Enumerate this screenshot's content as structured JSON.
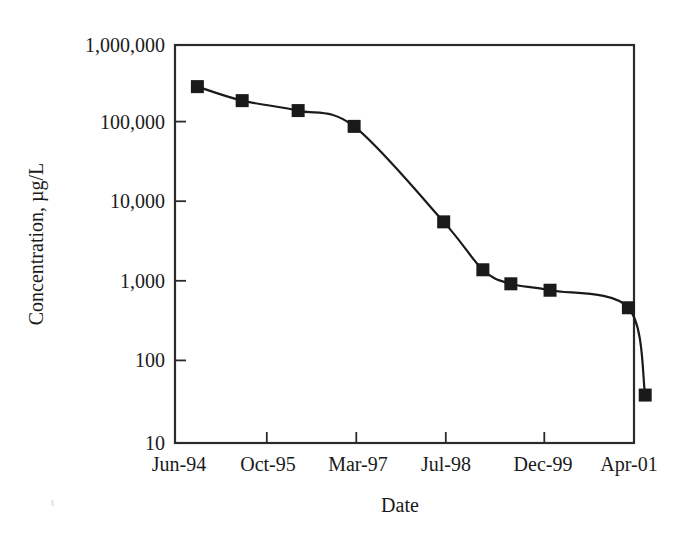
{
  "chart_data": {
    "type": "line",
    "title": "",
    "xlabel": "Date",
    "ylabel": "Concentration, µg/L",
    "yscale": "log",
    "ylim": [
      10,
      1000000
    ],
    "ytick_labels": [
      "1,000,000",
      "100,000",
      "10,000",
      "1,000",
      "100",
      "10"
    ],
    "ytick_values": [
      1000000,
      100000,
      10000,
      1000,
      100,
      10
    ],
    "xtick_labels": [
      "Jun-94",
      "Oct-95",
      "Mar-97",
      "Jul-98",
      "Dec-99",
      "Apr-01"
    ],
    "xtick_months": [
      0,
      16,
      33,
      49,
      66,
      82
    ],
    "xlim_months": [
      0,
      82
    ],
    "grid": false,
    "legend": false,
    "marker": "filled-square",
    "marker_color": "#1a1a1a",
    "line_color": "#1a1a1a",
    "series": [
      {
        "name": "Concentration",
        "points": [
          {
            "x_label": "Oct-94",
            "x_months": 4,
            "y": 300000
          },
          {
            "x_label": "Jun-95",
            "x_months": 12,
            "y": 200000
          },
          {
            "x_label": "Apr-96",
            "x_months": 22,
            "y": 150000
          },
          {
            "x_label": "Feb-97",
            "x_months": 32,
            "y": 95000
          },
          {
            "x_label": "Jun-98",
            "x_months": 48,
            "y": 6000
          },
          {
            "x_label": "Jan-99",
            "x_months": 55,
            "y": 1500
          },
          {
            "x_label": "Jun-99",
            "x_months": 60,
            "y": 1000
          },
          {
            "x_label": "Jan-00",
            "x_months": 67,
            "y": 830
          },
          {
            "x_label": "Apr-01",
            "x_months": 81,
            "y": 500
          },
          {
            "x_label": "Jul-01",
            "x_months": 84,
            "y": 40
          }
        ]
      }
    ]
  },
  "axes": {
    "y_title": "Concentration, µg/L",
    "x_title": "Date",
    "y_labels": [
      "1,000,000",
      "100,000",
      "10,000",
      "1,000",
      "100",
      "10"
    ],
    "x_labels": [
      "Jun-94",
      "Oct-95",
      "Mar-97",
      "Jul-98",
      "Dec-99",
      "Apr-01"
    ]
  }
}
